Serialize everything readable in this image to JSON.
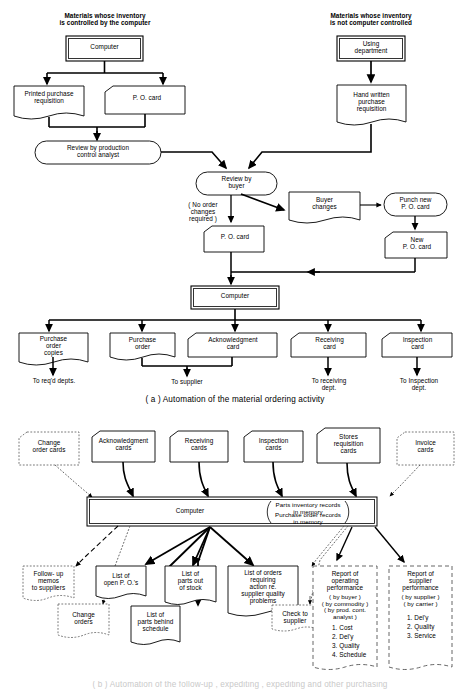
{
  "figure": {
    "caption_a": "( a ) Automation of the  material  ordering activity",
    "caption_b_partial": "( b ) Automation of the  follow-up  , expediting , expediting and  other  purchasing"
  },
  "diagram_a": {
    "headers": [
      {
        "id": "hdr-left",
        "text": "Materials whose inventory\nis controlled by the computer"
      },
      {
        "id": "hdr-right",
        "text": "Materials whose inventory\nis not computer controlled"
      }
    ],
    "nodes": [
      {
        "id": "computer-top",
        "shape": "double-box",
        "text": "Computer"
      },
      {
        "id": "printed-purchase-req",
        "shape": "document",
        "text": "Printed purchase\nrequisition"
      },
      {
        "id": "po-card-1",
        "shape": "punch-card",
        "text": "P. O. card"
      },
      {
        "id": "review-prod-control",
        "shape": "terminator",
        "text": "Review by production\ncontrol analyst"
      },
      {
        "id": "using-department",
        "shape": "double-box",
        "text": "Using\ndepartment"
      },
      {
        "id": "hand-written-req",
        "shape": "document",
        "text": "Hand written\npurchase\nrequisition"
      },
      {
        "id": "review-by-buyer",
        "shape": "terminator",
        "text": "Review by\nbuyer"
      },
      {
        "id": "buyer-changes",
        "shape": "tape",
        "text": "Buyer\nchanges"
      },
      {
        "id": "punch-new-po-card",
        "shape": "terminator",
        "text": "Punch new\nP. O. card"
      },
      {
        "id": "po-card-2",
        "shape": "punch-card",
        "text": "P. O. card"
      },
      {
        "id": "new-po-card",
        "shape": "punch-card",
        "text": "New\nP. O. card"
      },
      {
        "id": "computer-mid",
        "shape": "double-box",
        "text": "Computer"
      },
      {
        "id": "purchase-order-copies",
        "shape": "document",
        "text": "Purchase\norder\ncopies"
      },
      {
        "id": "purchase-order",
        "shape": "document",
        "text": "Purchase\norder"
      },
      {
        "id": "acknowledgment-card",
        "shape": "punch-card",
        "text": "Acknowledgment\ncard"
      },
      {
        "id": "receiving-card",
        "shape": "punch-card",
        "text": "Receiving\ncard"
      },
      {
        "id": "inspection-card",
        "shape": "punch-card",
        "text": "Inspection\ncard"
      }
    ],
    "edge_label_no_order": "( No order\nchanges\nrequired )",
    "destinations": [
      {
        "id": "dest-reqd-depts",
        "text": "To req'd depts."
      },
      {
        "id": "dest-supplier",
        "text": "To supplier"
      },
      {
        "id": "dest-receiving",
        "text": "To receiving\ndept."
      },
      {
        "id": "dest-inspection",
        "text": "To Inspection\ndept."
      }
    ]
  },
  "diagram_b": {
    "inputs": [
      {
        "id": "change-order-cards",
        "shape": "punch-card-dashed",
        "text": "Change\norder cards"
      },
      {
        "id": "acknowledgment-cards",
        "shape": "punch-card",
        "text": "Acknowledgment\ncards"
      },
      {
        "id": "receiving-cards",
        "shape": "punch-card",
        "text": "Receiving\ncards"
      },
      {
        "id": "inspection-cards",
        "shape": "punch-card",
        "text": "Inspection\ncards"
      },
      {
        "id": "stores-requisition-cards",
        "shape": "punch-card",
        "text": "Stores\nrequisition\ncards"
      },
      {
        "id": "invoice-cards",
        "shape": "punch-card-dashed",
        "text": "Invoice\ncards"
      }
    ],
    "computer": {
      "id": "computer-b",
      "label": "Computer",
      "memory_line_1": "Parts inventory records in memory",
      "memory_line_2": "Purchase order records in memory"
    },
    "outputs": [
      {
        "id": "follow-up-memos",
        "shape": "document-dashed",
        "text": "Follow- up\nmemos\nto suppliers"
      },
      {
        "id": "list-open-pos",
        "shape": "document",
        "text": "List of\nopen P. O.'s"
      },
      {
        "id": "list-parts-out",
        "shape": "document",
        "text": "List of\nparts out\nof stock"
      },
      {
        "id": "list-orders-action",
        "shape": "document",
        "text": "List of orders\nrequiring\naction re.\nsupplier quality\nproblems"
      }
    ],
    "secondary_outputs": [
      {
        "id": "change-orders",
        "shape": "document-dashed",
        "text": "Change\norders"
      },
      {
        "id": "list-parts-behind",
        "shape": "document",
        "text": "List of\nparts behind\nschedule"
      },
      {
        "id": "check-to-supplier",
        "shape": "document-dashed",
        "text": "Check to\nsupplier"
      }
    ],
    "reports": [
      {
        "id": "report-operating-performance",
        "shape": "document-dashed",
        "title": "Report of\noperating\nperformance",
        "qualifiers": "( by buyer )\n( by commodity )\n( by prod. cont.\nanalyst )",
        "items": [
          "1. Cost",
          "2. Del'y",
          "3. Quality",
          "4. Schedule"
        ]
      },
      {
        "id": "report-supplier-performance",
        "shape": "document-dashed",
        "title": "Report of\nsupplier\nperformance",
        "qualifiers": "( by supplier )\n( by carrier )",
        "items": [
          "1. Del'y",
          "2. Quality",
          "3. Service"
        ]
      }
    ]
  },
  "colors": {
    "ink": "#000000",
    "paper": "#ffffff",
    "faint": "#8a8a8a"
  }
}
